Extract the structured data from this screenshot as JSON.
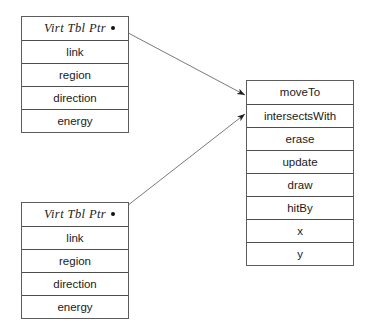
{
  "diagram": {
    "background_color": "#ffffff",
    "border_color": "#5c5c5c",
    "line_color": "#777777",
    "text_color": "#1a1a1a",
    "objects": [
      {
        "name": "object-instance-top",
        "header": "Virt Tbl Ptr",
        "fields": [
          "link",
          "region",
          "direction",
          "energy"
        ]
      },
      {
        "name": "object-instance-bottom",
        "header": "Virt Tbl Ptr",
        "fields": [
          "link",
          "region",
          "direction",
          "energy"
        ]
      }
    ],
    "vtable": {
      "name": "virtual-function-table",
      "entries": [
        "moveTo",
        "intersectsWith",
        "erase",
        "update",
        "draw",
        "hitBy",
        "x",
        "y"
      ]
    },
    "connectors": [
      {
        "name": "pointer-arrow-top",
        "from": "object-instance-top.Virt Tbl Ptr",
        "to": "virtual-function-table.moveTo"
      },
      {
        "name": "pointer-arrow-bottom",
        "from": "object-instance-bottom.Virt Tbl Ptr",
        "to": "virtual-function-table.intersectsWith"
      }
    ]
  }
}
